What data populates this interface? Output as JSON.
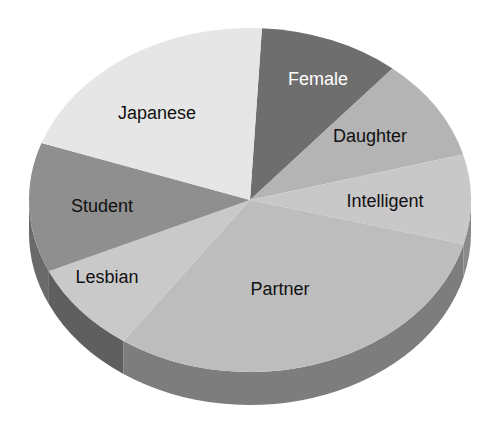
{
  "chart_data": {
    "type": "pie",
    "style": "3d",
    "title": "",
    "legend": "none",
    "start_angle_deg": -86.9,
    "direction": "clockwise",
    "categories": [
      "Female",
      "Daughter",
      "Intelligent",
      "Partner",
      "Lesbian",
      "Student",
      "Japanese"
    ],
    "values": [
      10.3,
      9.6,
      8.4,
      30.6,
      8.5,
      12.2,
      20.5
    ],
    "colors": [
      "#6e6e6e",
      "#b4b4b4",
      "#c8c8c8",
      "#bdbdbd",
      "#c9c9c9",
      "#8f8f8f",
      "#e6e6e6"
    ],
    "label_colors": [
      "#ffffff",
      "#111111",
      "#111111",
      "#111111",
      "#111111",
      "#111111",
      "#111111"
    ],
    "label_positions": [
      [
        318,
        80
      ],
      [
        370,
        137
      ],
      [
        385,
        202
      ],
      [
        280,
        290
      ],
      [
        107,
        278
      ],
      [
        102,
        207
      ],
      [
        157,
        114
      ]
    ]
  },
  "geometry": {
    "cx": 250,
    "cy": 200,
    "rx": 221,
    "ry": 172,
    "depth": 33,
    "side_colors": {
      "Partner": "#7d7d7d",
      "Lesbian": "#5f5f5f",
      "Student": "#6a6a6a",
      "Intelligent": "#8a8a8a"
    }
  }
}
